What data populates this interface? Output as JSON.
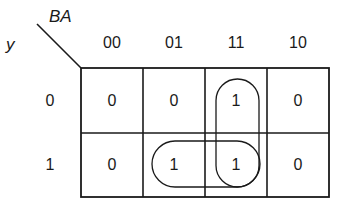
{
  "kmap": {
    "column_variable": "BA",
    "row_variable": "y",
    "column_labels": [
      "00",
      "01",
      "11",
      "10"
    ],
    "row_labels": [
      "0",
      "1"
    ],
    "cells": [
      [
        "0",
        "0",
        "1",
        "0"
      ],
      [
        "0",
        "1",
        "1",
        "0"
      ]
    ],
    "groupings": [
      {
        "name": "vertical-loop",
        "cells": [
          [
            0,
            2
          ],
          [
            1,
            2
          ]
        ]
      },
      {
        "name": "horizontal-loop",
        "cells": [
          [
            1,
            1
          ],
          [
            1,
            2
          ]
        ]
      }
    ],
    "colors": {
      "line": "#1a1a1a",
      "background": "#ffffff"
    }
  }
}
